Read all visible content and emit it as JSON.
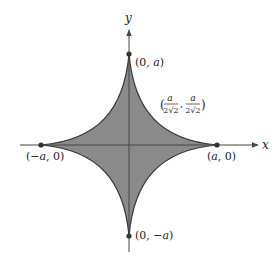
{
  "diagram": {
    "axes": {
      "x_label": "x",
      "y_label": "y"
    },
    "points": {
      "top": {
        "label_open": "(0, ",
        "label_var": "a",
        "label_close": ")"
      },
      "bottom": {
        "label_open": "(0, ",
        "label_var": "−a",
        "label_close": ")"
      },
      "left": {
        "label_open": "(",
        "label_var": "−a",
        "label_close": ", 0)"
      },
      "right": {
        "label_open": "(",
        "label_var": "a",
        "label_close": ", 0)"
      },
      "diagonal": {
        "num": "a",
        "den": "2√2",
        "comma": ","
      }
    },
    "colors": {
      "fill": "#8a8a8a",
      "stroke": "#333333",
      "axis": "#444444"
    }
  }
}
